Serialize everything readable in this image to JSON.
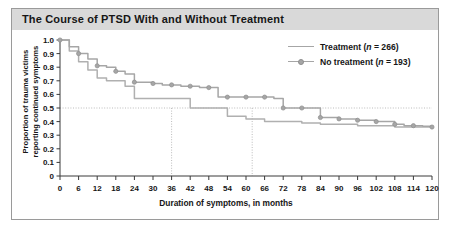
{
  "figure": {
    "title": "The Course of PTSD With and Without Treatment"
  },
  "legend": {
    "position": "top-right",
    "items": [
      {
        "label": "Treatment (n = 266)",
        "marker": "line-only",
        "color": "#a6a6a6"
      },
      {
        "label": "No treatment (n = 193)",
        "marker": "line-circle",
        "color": "#a6a6a6"
      }
    ]
  },
  "axes": {
    "ylabel_line1": "Proportion of trauma victims",
    "ylabel_line2": "reporting continued symptoms",
    "xlabel": "Duration of symptoms, in months",
    "yticks": [
      "0",
      "0.1",
      "0.2",
      "0.3",
      "0.4",
      "0.5",
      "0.6",
      "0.7",
      "0.8",
      "0.9",
      "1.0"
    ],
    "xticks": [
      "0",
      "6",
      "12",
      "18",
      "24",
      "30",
      "36",
      "42",
      "48",
      "54",
      "60",
      "66",
      "72",
      "78",
      "84",
      "90",
      "96",
      "102",
      "108",
      "114",
      "120"
    ]
  },
  "chart_data": {
    "type": "line",
    "title": "The Course of PTSD With and Without Treatment",
    "xlabel": "Duration of symptoms, in months",
    "ylabel": "Proportion of trauma victims reporting continued symptoms",
    "xlim": [
      0,
      120
    ],
    "ylim": [
      0,
      1.0
    ],
    "grid": false,
    "legend_position": "top-right",
    "step_style": "post",
    "reference_lines": {
      "horizontal": {
        "y": 0.5,
        "style": "dotted",
        "color": "#b4b4b4"
      },
      "vertical": [
        {
          "x": 36,
          "label": "median treatment",
          "style": "dotted",
          "color": "#b4b4b4"
        },
        {
          "x": 62,
          "label": "median no treatment",
          "style": "dotted",
          "color": "#b4b4b4"
        }
      ]
    },
    "series": [
      {
        "name": "Treatment (n = 266)",
        "n": 266,
        "color": "#b0b0b0",
        "markers": false,
        "x": [
          0,
          3,
          6,
          9,
          12,
          15,
          18,
          21,
          24,
          30,
          36,
          42,
          48,
          54,
          60,
          62,
          66,
          72,
          78,
          84,
          90,
          96,
          102,
          108,
          114,
          120
        ],
        "y": [
          1.0,
          0.92,
          0.84,
          0.78,
          0.72,
          0.7,
          0.7,
          0.66,
          0.57,
          0.57,
          0.57,
          0.5,
          0.5,
          0.44,
          0.42,
          0.42,
          0.4,
          0.4,
          0.39,
          0.38,
          0.38,
          0.37,
          0.37,
          0.36,
          0.36,
          0.355
        ]
      },
      {
        "name": "No treatment (n = 193)",
        "n": 193,
        "color": "#a6a6a6",
        "markers": true,
        "x": [
          0,
          3,
          6,
          9,
          12,
          15,
          18,
          21,
          24,
          27,
          30,
          33,
          36,
          39,
          42,
          45,
          48,
          51,
          54,
          57,
          60,
          62,
          66,
          69,
          72,
          75,
          78,
          81,
          84,
          87,
          90,
          93,
          96,
          99,
          102,
          105,
          108,
          111,
          114,
          117,
          120
        ],
        "y": [
          1.0,
          0.95,
          0.9,
          0.86,
          0.81,
          0.8,
          0.77,
          0.75,
          0.69,
          0.69,
          0.68,
          0.67,
          0.67,
          0.66,
          0.66,
          0.65,
          0.65,
          0.58,
          0.58,
          0.58,
          0.58,
          0.58,
          0.58,
          0.57,
          0.5,
          0.5,
          0.5,
          0.5,
          0.43,
          0.43,
          0.42,
          0.42,
          0.41,
          0.41,
          0.4,
          0.4,
          0.38,
          0.37,
          0.37,
          0.365,
          0.36
        ]
      }
    ]
  }
}
